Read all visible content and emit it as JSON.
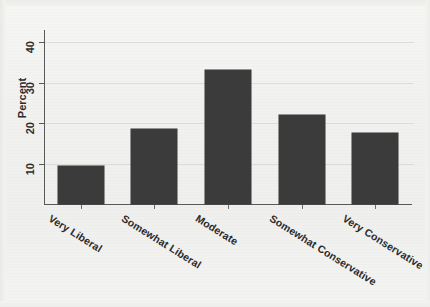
{
  "chart_data": {
    "type": "bar",
    "title": "",
    "subtitle": "",
    "xlabel": "",
    "ylabel": "Percent",
    "categories": [
      "Very Liberal",
      "Somewhat Liberal",
      "Moderate",
      "Somewhat Conservative",
      "Very Conservative"
    ],
    "values": [
      9.4,
      18.5,
      33.0,
      22.0,
      17.5
    ],
    "ylim": [
      0,
      43
    ],
    "yticks": [
      10,
      20,
      30,
      40
    ],
    "ytick_labels": [
      "10",
      "20",
      "30",
      "40"
    ],
    "grid": "horizontal",
    "legend": "none",
    "bar_color": "#3b3b3b",
    "axis_color": "#595959",
    "grid_color": "#dcdcd9",
    "background": "#f2f2f0"
  },
  "axis": {
    "y_title": "Percent"
  }
}
